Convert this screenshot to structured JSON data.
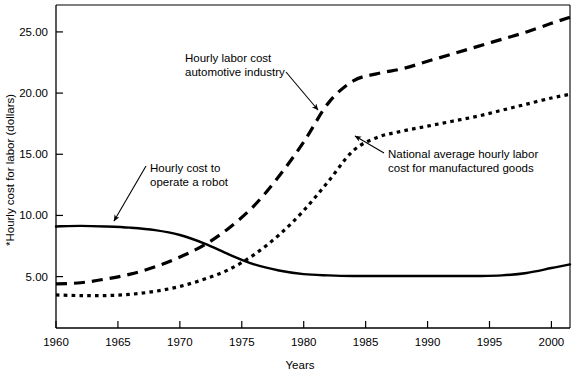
{
  "chart_data": {
    "type": "line",
    "title": "",
    "xlabel": "Years",
    "ylabel": "*Hourly cost for labor (dollars)",
    "xlim": [
      1960,
      2001.5
    ],
    "ylim": [
      0.8,
      27.2
    ],
    "xticks": [
      "1960",
      "1965",
      "1970",
      "1975",
      "1980",
      "1985",
      "1990",
      "1995",
      "2000"
    ],
    "xtick_values": [
      1960,
      1965,
      1970,
      1975,
      1980,
      1985,
      1990,
      1995,
      2000
    ],
    "yticks": [
      "5.00",
      "10.00",
      "15.00",
      "20.00",
      "25.00"
    ],
    "ytick_values": [
      5,
      10,
      15,
      20,
      25
    ],
    "grid": false,
    "legend": "none (inline annotations with leader arrows)",
    "x": [
      1960,
      1962,
      1964,
      1966,
      1968,
      1970,
      1972,
      1974,
      1976,
      1978,
      1980,
      1982,
      1984,
      1986,
      1988,
      1990,
      1992,
      1994,
      1996,
      1998,
      2000,
      2001.5
    ],
    "series": [
      {
        "name": "Hourly cost to operate a robot",
        "style": "solid",
        "values": [
          9.1,
          9.15,
          9.1,
          9.0,
          8.8,
          8.4,
          7.7,
          6.8,
          6.0,
          5.5,
          5.2,
          5.1,
          5.05,
          5.05,
          5.05,
          5.05,
          5.05,
          5.05,
          5.1,
          5.3,
          5.7,
          6.0
        ]
      },
      {
        "name": "Hourly labor cost automotive industry",
        "style": "dashed",
        "values": [
          4.4,
          4.5,
          4.8,
          5.2,
          5.8,
          6.6,
          7.6,
          9.0,
          10.8,
          13.2,
          16.0,
          19.2,
          21.0,
          21.6,
          22.0,
          22.6,
          23.2,
          23.8,
          24.4,
          25.0,
          25.7,
          26.2
        ]
      },
      {
        "name": "National average hourly labor cost for manufactured goods",
        "style": "dotted",
        "values": [
          3.5,
          3.45,
          3.45,
          3.55,
          3.8,
          4.2,
          4.8,
          5.6,
          6.8,
          8.4,
          10.4,
          12.8,
          15.3,
          16.4,
          16.9,
          17.3,
          17.7,
          18.1,
          18.6,
          19.1,
          19.6,
          19.9
        ]
      }
    ],
    "annotations": [
      {
        "id": "annot-automotive",
        "lines": [
          "Hourly labor cost",
          "automotive industry"
        ],
        "text_x": 185,
        "text_y": 62,
        "arrow_from_x": 286,
        "arrow_from_y": 72,
        "arrow_to_x": 318,
        "arrow_to_y": 110,
        "target_series": "Hourly labor cost automotive industry"
      },
      {
        "id": "annot-robot",
        "lines": [
          "Hourly cost to",
          "operate a robot"
        ],
        "text_x": 150,
        "text_y": 172,
        "arrow_from_x": 146,
        "arrow_from_y": 166,
        "arrow_to_x": 114,
        "arrow_to_y": 221,
        "target_series": "Hourly cost to operate a robot"
      },
      {
        "id": "annot-national",
        "lines": [
          "National average hourly labor",
          "cost for manufactured goods"
        ],
        "text_x": 388,
        "text_y": 158,
        "arrow_from_x": 384,
        "arrow_from_y": 153,
        "arrow_to_x": 355,
        "arrow_to_y": 136,
        "target_series": "National average hourly labor cost for manufactured goods"
      }
    ],
    "colors": {
      "line": "#000000",
      "axis": "#000000",
      "background": "#ffffff"
    }
  }
}
